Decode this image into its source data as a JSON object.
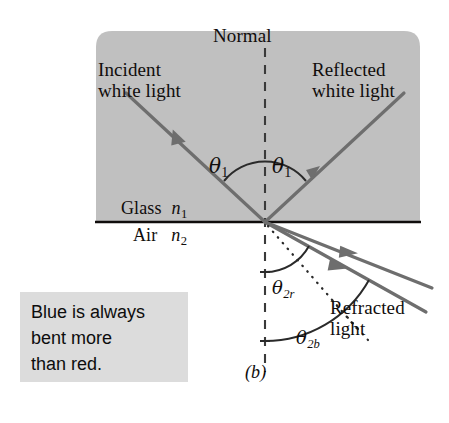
{
  "figure": {
    "caption": "(b)",
    "labels": {
      "normal": "Normal",
      "incident": "Incident\nwhite light",
      "reflected": "Reflected\nwhite light",
      "glass": "Glass",
      "glass_index": "n",
      "glass_index_sub": "1",
      "air": "Air",
      "air_index": "n",
      "air_index_sub": "2",
      "refracted": "Refracted\nlight"
    },
    "angles": {
      "theta_incident": "θ",
      "theta_incident_sub": "1",
      "theta_reflected": "θ",
      "theta_reflected_sub": "1",
      "theta_refracted_red": "θ",
      "theta_refracted_red_sub": "2r",
      "theta_refracted_blue": "θ",
      "theta_refracted_blue_sub": "2b"
    },
    "callout": {
      "text": "Blue is always\nbent more\nthan red.",
      "background": "#dcdcdc"
    },
    "colors": {
      "medium_background": "#c0c0c0",
      "ray": "#6e6e6e",
      "interface_line": "#100d0c",
      "normal_dash": "#3a3a3a",
      "arc": "#2a2a2a",
      "dotted_guide": "#2a2a2a",
      "page_background": "#ffffff"
    },
    "geometry": {
      "vertex_x": 265,
      "vertex_y": 222,
      "interface_y": 222,
      "medium_box": {
        "x": 96,
        "y": 31,
        "width": 324,
        "height": 191
      },
      "normal_x": 265,
      "normal_top_y": 48,
      "normal_bottom_y": 372,
      "incident_start": {
        "x": 126,
        "y": 93
      },
      "reflected_end": {
        "x": 404,
        "y": 93
      },
      "refracted_red_end": {
        "x": 430,
        "y": 288
      },
      "refracted_blue_end": {
        "x": 424,
        "y": 310
      },
      "dotted_guide_end": {
        "x": 358,
        "y": 330
      }
    }
  }
}
